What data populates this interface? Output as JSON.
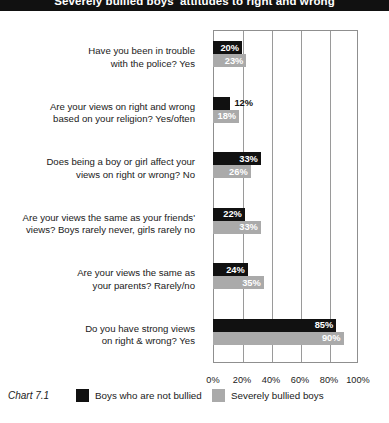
{
  "title": "Severely bullied boys' attitudes to right and wrong",
  "chart_number": "Chart 7.1",
  "legend": {
    "position": "bottom",
    "entries": [
      {
        "label": "Boys who are not bullied",
        "color": "#111111"
      },
      {
        "label": "Severely bullied boys",
        "color": "#aaaaaa"
      }
    ]
  },
  "chart_data": {
    "type": "bar",
    "orientation": "horizontal",
    "title": "Severely bullied boys' attitudes to right and wrong",
    "xlabel": "",
    "ylabel": "",
    "xlim": [
      0,
      100
    ],
    "grid": true,
    "tick_labels": [
      "0%",
      "20%",
      "40%",
      "60%",
      "80%",
      "100%"
    ],
    "tick_values": [
      0,
      20,
      40,
      60,
      80,
      100
    ],
    "categories": [
      "Have you been in trouble with the police? Yes",
      "Are your views on right and wrong based on your religion? Yes/often",
      "Does being a boy or girl affect your views on right or wrong? No",
      "Are your views the same as your friends' views? Boys rarely never, girls rarely no",
      "Are your views the same as your parents? Rarely/no",
      "Do you have strong views on right & wrong? Yes"
    ],
    "category_lines": [
      [
        "Have you been in trouble",
        "with the police? Yes"
      ],
      [
        "Are your views on right and wrong",
        "based on your religion? Yes/often"
      ],
      [
        "Does being a boy or girl affect your",
        "views on right or wrong? No"
      ],
      [
        "Are your views the same as your friends'",
        "views? Boys rarely never, girls rarely no"
      ],
      [
        "Are your views the same as",
        "your parents? Rarely/no"
      ],
      [
        "Do you have strong views",
        "on right & wrong? Yes"
      ]
    ],
    "series": [
      {
        "name": "Boys who are not bullied",
        "color": "#111111",
        "values": [
          20,
          12,
          33,
          22,
          24,
          85
        ],
        "labels": [
          "20%",
          "12%",
          "33%",
          "22%",
          "24%",
          "85%"
        ]
      },
      {
        "name": "Severely bullied boys",
        "color": "#aaaaaa",
        "values": [
          23,
          18,
          26,
          33,
          35,
          90
        ],
        "labels": [
          "23%",
          "18%",
          "26%",
          "33%",
          "35%",
          "90%"
        ]
      }
    ]
  }
}
